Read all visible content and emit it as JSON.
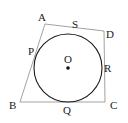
{
  "figure": {
    "type": "geometry-diagram",
    "width": 128,
    "height": 123,
    "background_color": "#ffffff",
    "stroke_color_quadrilateral": "#8a8a8a",
    "stroke_color_circle": "#1a1a1a",
    "label_color": "#1a1a1a"
  },
  "labels": [
    {
      "id": "A",
      "text": "A",
      "x": 38,
      "y": 12,
      "role": "vertex-label"
    },
    {
      "id": "S",
      "text": "S",
      "x": 72,
      "y": 19,
      "role": "tangent-point-label"
    },
    {
      "id": "D",
      "text": "D",
      "x": 106,
      "y": 29,
      "role": "vertex-label"
    },
    {
      "id": "P",
      "text": "P",
      "x": 28,
      "y": 46,
      "role": "tangent-point-label"
    },
    {
      "id": "O",
      "text": "O",
      "x": 64,
      "y": 54,
      "role": "center-label"
    },
    {
      "id": "R",
      "text": "R",
      "x": 104,
      "y": 63,
      "role": "tangent-point-label"
    },
    {
      "id": "B",
      "text": "B",
      "x": 9,
      "y": 100,
      "role": "vertex-label"
    },
    {
      "id": "Q",
      "text": "Q",
      "x": 63,
      "y": 105,
      "role": "tangent-point-label"
    },
    {
      "id": "C",
      "text": "C",
      "x": 110,
      "y": 100,
      "role": "vertex-label"
    }
  ],
  "geometry": {
    "quadrilateral": {
      "name": "ABCD",
      "vertices": [
        {
          "id": "A",
          "x": 45,
          "y": 24
        },
        {
          "id": "D",
          "x": 104,
          "y": 31
        },
        {
          "id": "C",
          "x": 105,
          "y": 102
        },
        {
          "id": "B",
          "x": 20,
          "y": 102
        }
      ],
      "stroke_width": 0.8
    },
    "circle": {
      "center": {
        "x": 68,
        "y": 68
      },
      "radius": 34,
      "stroke_width": 1.1
    },
    "center_dot": {
      "x": 68,
      "y": 68,
      "radius": 1.8
    },
    "tangent_points": [
      {
        "id": "P",
        "x": 36,
        "y": 52,
        "on_segment": "AB"
      },
      {
        "id": "Q",
        "x": 68,
        "y": 102,
        "on_segment": "BC"
      },
      {
        "id": "R",
        "x": 102,
        "y": 70,
        "on_segment": "CD"
      },
      {
        "id": "S",
        "x": 73,
        "y": 35,
        "on_segment": "DA"
      }
    ]
  }
}
